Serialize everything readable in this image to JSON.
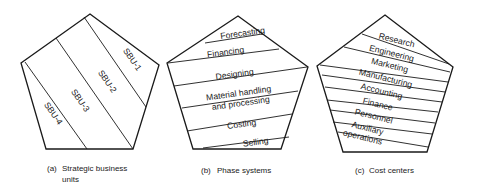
{
  "diagrams": [
    {
      "id": "a",
      "caption_tag": "(a)",
      "caption_line1": "Strategic business",
      "caption_line2": "units",
      "labels": [
        "SBU-1",
        "SBU-2",
        "SBU-3",
        "SBU-4"
      ]
    },
    {
      "id": "b",
      "caption_tag": "(b)",
      "caption_line1": "Phase systems",
      "labels": [
        "Forecasting",
        "Financing",
        "Designing",
        "Material handling",
        "and processing",
        "Costing",
        "Selling"
      ]
    },
    {
      "id": "c",
      "caption_tag": "(c)",
      "caption_line1": "Cost centers",
      "labels": [
        "Research",
        "Engineering",
        "Marketing",
        "Manufacturing",
        "Accounting",
        "Finance",
        "Personnel",
        "Auxiliary",
        "operations"
      ]
    }
  ],
  "colors": {
    "ink": "#1a1a1a",
    "background": "#ffffff"
  }
}
